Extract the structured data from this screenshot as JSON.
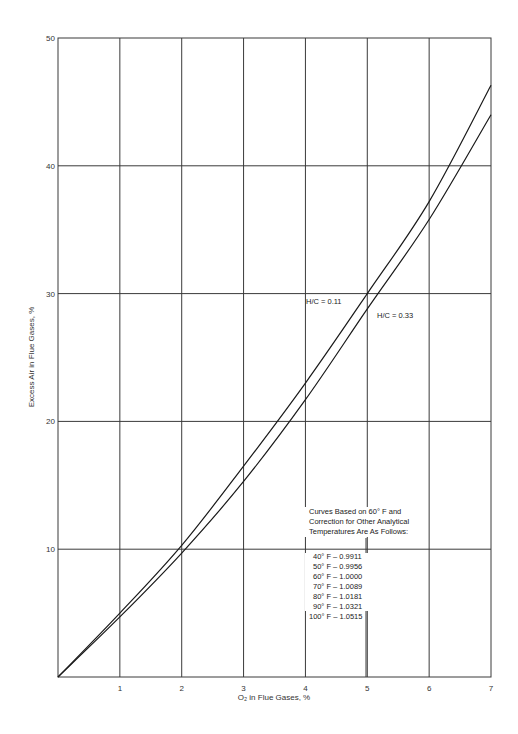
{
  "chart_data": {
    "type": "line",
    "title": "",
    "xlabel": "O2 in Flue Gases, %",
    "ylabel": "Excess Air in Flue Gases, %",
    "xlim": [
      0,
      7
    ],
    "ylim": [
      0,
      50
    ],
    "x_ticks": [
      "1",
      "2",
      "3",
      "4",
      "5",
      "6",
      "7"
    ],
    "y_ticks": [
      "10",
      "20",
      "30",
      "40",
      "50"
    ],
    "grid": true,
    "legend": "none (curves labeled inline)",
    "x": [
      0,
      1,
      2,
      3,
      4,
      5,
      6,
      7
    ],
    "series": [
      {
        "name": "H/C = 0.11",
        "values": [
          0,
          5.0,
          10.3,
          16.5,
          23.0,
          30.0,
          37.2,
          46.3
        ]
      },
      {
        "name": "H/C = 0.33",
        "values": [
          0,
          4.7,
          9.7,
          15.3,
          21.7,
          28.8,
          35.8,
          44.0
        ]
      }
    ],
    "annotations": {
      "curve_labels": [
        "H/C = 0.11",
        "H/C = 0.33"
      ],
      "note_lines": [
        "Curves Based on 60° F and",
        "Correction for Other Analytical",
        "Temperatures Are As Follows:"
      ],
      "corrections": [
        {
          "temp": "40° F",
          "factor": "0.9911"
        },
        {
          "temp": "50° F",
          "factor": "0.9956"
        },
        {
          "temp": "60° F",
          "factor": "1.0000"
        },
        {
          "temp": "70° F",
          "factor": "1.0089"
        },
        {
          "temp": "80° F",
          "factor": "1.0181"
        },
        {
          "temp": "90° F",
          "factor": "1.0321"
        },
        {
          "temp": "100° F",
          "factor": "1.0515"
        }
      ]
    }
  },
  "labels": {
    "x_axis": "O₂ in Flue Gases, %",
    "y_axis": "Excess Air in Flue Gases, %",
    "curve_a": "H/C = 0.11",
    "curve_b": "H/C = 0.33",
    "note_1": "Curves Based on 60° F and",
    "note_2": "Correction for Other Analytical",
    "note_3": "Temperatures Are As Follows:",
    "corr_0": "40° F  –  0.9911",
    "corr_1": "50° F  –  0.9956",
    "corr_2": "60° F  –  1.0000",
    "corr_3": "70° F  –  1.0089",
    "corr_4": "80° F  –  1.0181",
    "corr_5": "90° F  –  1.0321",
    "corr_6": "100° F  –  1.0515"
  },
  "style": {
    "line_color": "#1a1a1a",
    "grid_color": "#3a3a3a"
  }
}
